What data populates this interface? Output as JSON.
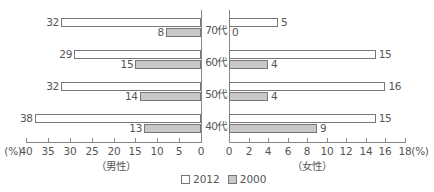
{
  "chart_data": {
    "type": "bar",
    "orientation": "horizontal-butterfly",
    "categories": [
      "70代",
      "60代",
      "50代",
      "40代"
    ],
    "panels": [
      {
        "name": "男性",
        "label": "（男性）",
        "direction": "left",
        "xlim": [
          0,
          40
        ],
        "ticks": [
          40,
          35,
          30,
          25,
          20,
          15,
          10,
          5,
          0
        ],
        "unit_label": "(%)",
        "series": [
          {
            "name": "2012",
            "values": [
              32,
              29,
              32,
              38
            ]
          },
          {
            "name": "2000",
            "values": [
              8,
              15,
              14,
              13
            ]
          }
        ]
      },
      {
        "name": "女性",
        "label": "（女性）",
        "direction": "right",
        "xlim": [
          0,
          18
        ],
        "ticks": [
          0,
          2,
          4,
          6,
          8,
          10,
          12,
          14,
          16,
          18
        ],
        "unit_label": "(%)",
        "series": [
          {
            "name": "2012",
            "values": [
              5,
              15,
              16,
              15
            ]
          },
          {
            "name": "2000",
            "values": [
              0,
              4,
              4,
              9
            ]
          }
        ]
      }
    ],
    "legend": [
      "2012",
      "2000"
    ],
    "legend_position": "bottom-center",
    "colors": {
      "2012": "#ffffff",
      "2000": "#c8c8c8"
    },
    "grid": false
  },
  "labels": {
    "male": "（男性）",
    "female": "（女性）",
    "left_unit": "(%)",
    "right_unit": "(%)",
    "legend_2012": "2012",
    "legend_2000": "2000"
  }
}
